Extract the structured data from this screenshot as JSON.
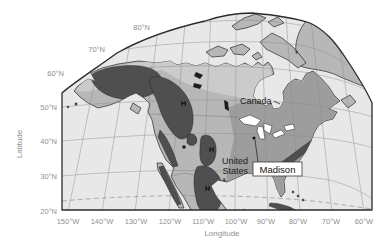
{
  "figure": {
    "type": "geographic-map",
    "region_shown": "North America",
    "projection_style": "curved globe view"
  },
  "axes": {
    "lat_title": "Latitude",
    "lon_title": "Longitude",
    "lat_ticks": [
      "80°N",
      "70°N",
      "60°N",
      "50°N",
      "40°N",
      "30°N",
      "20°N"
    ],
    "lon_ticks": [
      "150°W",
      "140°W",
      "130°W",
      "120°W",
      "110°W",
      "100°W",
      "90°W",
      "80°W",
      "70°W",
      "60°W"
    ]
  },
  "map": {
    "labels": {
      "canada": "Canada",
      "us_line1": "United",
      "us_line2": "States",
      "madison": "Madison"
    },
    "h_markers": [
      {
        "label": "H"
      },
      {
        "label": "H"
      },
      {
        "label": "H"
      }
    ]
  },
  "colors": {
    "ocean": "#e9e9e9",
    "land": "#b7b7b7",
    "land-light": "#cbcbcb",
    "land-dark": "#9d9d9d",
    "highland": "#4f4f4f",
    "water": "#ffffff",
    "frame": "#2b2b2b",
    "coast": "#262626",
    "grid": "#8a8a8a",
    "axis-text": "#8f8f8f",
    "label-text": "#1c1c1c"
  }
}
